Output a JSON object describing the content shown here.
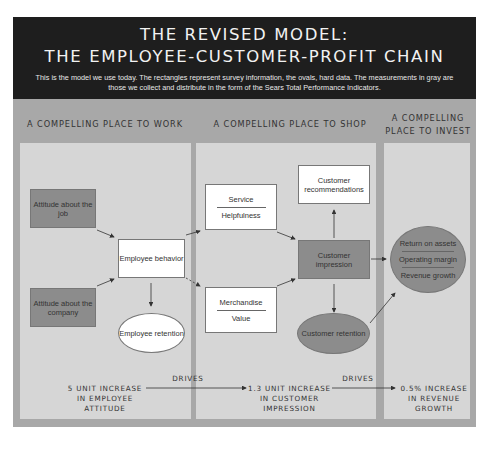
{
  "header": {
    "title_line1": "THE REVISED MODEL:",
    "title_line2": "THE EMPLOYEE-CUSTOMER-PROFIT CHAIN",
    "description": "This is the model we use today. The rectangles represent survey information, the ovals, hard data. The measurements in gray are those we collect and distribute in the form of the Sears Total Performance Indicators."
  },
  "columns": [
    {
      "title": "A COMPELLING PLACE TO WORK"
    },
    {
      "title": "A COMPELLING PLACE TO SHOP"
    },
    {
      "title_line1": "A COMPELLING",
      "title_line2": "PLACE TO INVEST"
    }
  ],
  "nodes": {
    "attitude_job": "Attitude about the job",
    "attitude_company": "Attitude about the company",
    "employee_behavior": "Employee behavior",
    "employee_retention": "Employee retention",
    "service_top": "Service",
    "service_bottom": "Helpfulness",
    "merch_top": "Merchandise",
    "merch_bottom": "Value",
    "customer_recommendations": "Customer recommendations",
    "customer_impression": "Customer impression",
    "customer_retention": "Customer retention",
    "financial": [
      "Return on assets",
      "Operating margin",
      "Revenue growth"
    ]
  },
  "footer": {
    "left": [
      "5 UNIT INCREASE",
      "IN EMPLOYEE",
      "ATTITUDE"
    ],
    "middle": [
      "1.3 UNIT INCREASE",
      "IN CUSTOMER",
      "IMPRESSION"
    ],
    "right": [
      "0.5% INCREASE",
      "IN REVENUE",
      "GROWTH"
    ],
    "drives1": "DRIVES",
    "drives2": "DRIVES"
  }
}
